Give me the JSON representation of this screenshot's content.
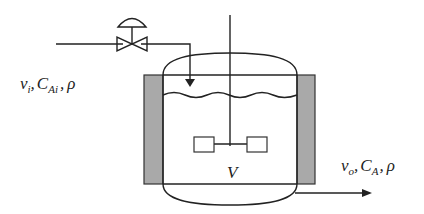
{
  "diagram": {
    "type": "process-flow",
    "inlet_label": {
      "flow": "v",
      "flow_sub": "i",
      "conc": "C",
      "conc_sub": "Ai",
      "density": "ρ",
      "sep": ","
    },
    "outlet_label": {
      "flow": "v",
      "flow_sub": "o",
      "conc": "C",
      "conc_sub": "A",
      "density": "ρ",
      "sep": ","
    },
    "volume_label": "V",
    "colors": {
      "line": "#222222",
      "jacket": "#a9a9a9",
      "background": "#ffffff"
    }
  }
}
